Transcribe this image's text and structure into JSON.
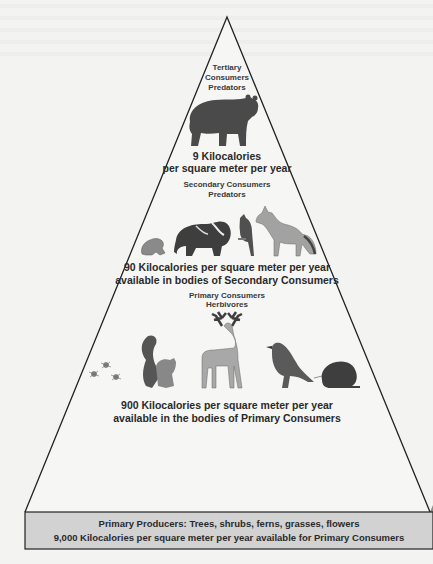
{
  "diagram": {
    "type": "energy-pyramid",
    "colors": {
      "background": "#f3f3f1",
      "band_fill": "#c9c9c9",
      "outline": "#222222",
      "ground": "#8c8c8c",
      "tree_dark": "#3a3a3a",
      "tree_light": "#b0b0b0",
      "animal_dark": "#4a4a4a",
      "animal_light": "#9a9a9a"
    },
    "levels": [
      {
        "id": "tertiary",
        "title_lines": [
          "Tertiary",
          "Consumers",
          "Predators"
        ],
        "organisms": [
          "bear"
        ],
        "energy_lines": [
          "9 Kilocalories",
          "per square meter per year"
        ]
      },
      {
        "id": "secondary",
        "title_lines": [
          "Secondary Consumers",
          "Predators"
        ],
        "organisms": [
          "frog",
          "badger",
          "blue-jay",
          "fox"
        ],
        "energy_lines": [
          "90 Kilocalories per square meter per year",
          "available in bodies of Secondary Consumers"
        ]
      },
      {
        "id": "primary",
        "title_lines": [
          "Primary Consumers",
          "Herbivores"
        ],
        "organisms": [
          "insects",
          "squirrel",
          "deer",
          "bird",
          "vole"
        ],
        "energy_lines": [
          "900 Kilocalories per square meter per year",
          "available in the bodies of Primary Consumers"
        ]
      },
      {
        "id": "producers",
        "organisms": [
          "conifer-trees"
        ],
        "energy_lines": [
          "Primary Producers: Trees, shrubs, ferns, grasses, flowers",
          "9,000 Kilocalories per square meter per year available for Primary Consumers"
        ]
      }
    ]
  }
}
